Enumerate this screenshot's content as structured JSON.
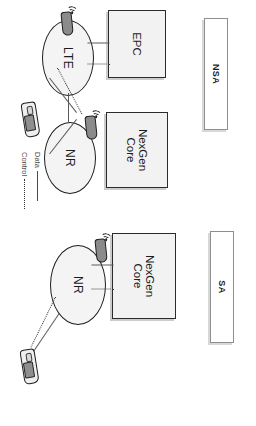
{
  "figure": {
    "sections": [
      {
        "id": "nsa",
        "plaque_label": "NSA",
        "core_boxes": [
          {
            "id": "epc",
            "label": "EPC"
          },
          {
            "id": "nexgen_core",
            "label": "NexGen\nCore"
          }
        ],
        "cells": [
          {
            "id": "lte",
            "label": "LTE"
          },
          {
            "id": "nr",
            "label": "NR"
          }
        ],
        "devices": [
          {
            "id": "ue",
            "icon": "handset-icon"
          },
          {
            "id": "lte-antenna",
            "icon": "antenna-icon"
          },
          {
            "id": "nr-antenna",
            "icon": "antenna-icon"
          }
        ],
        "links": [
          {
            "from": "epc",
            "to": "lte",
            "type": "Data"
          },
          {
            "from": "epc",
            "to": "lte",
            "type": "Control"
          },
          {
            "from": "lte",
            "to": "nr",
            "type": "Data"
          },
          {
            "from": "ue",
            "to": "lte",
            "type": "Data"
          },
          {
            "from": "ue",
            "to": "lte",
            "type": "Control"
          },
          {
            "from": "ue",
            "to": "nr",
            "type": "Data"
          }
        ]
      },
      {
        "id": "sa",
        "plaque_label": "SA",
        "core_boxes": [
          {
            "id": "nexgen_core",
            "label": "NexGen\nCore"
          }
        ],
        "cells": [
          {
            "id": "nr",
            "label": "NR"
          }
        ],
        "devices": [
          {
            "id": "ue",
            "icon": "handset-icon"
          },
          {
            "id": "nr-antenna",
            "icon": "antenna-icon"
          }
        ],
        "links": [
          {
            "from": "nexgen_core",
            "to": "nr",
            "type": "Data"
          },
          {
            "from": "nexgen_core",
            "to": "nr",
            "type": "Control"
          },
          {
            "from": "ue",
            "to": "nr",
            "type": "Data"
          },
          {
            "from": "ue",
            "to": "nr",
            "type": "Control"
          }
        ]
      }
    ],
    "legend": {
      "items": [
        {
          "label": "Data",
          "style": "solid"
        },
        {
          "label": "Control",
          "style": "dotted"
        }
      ]
    },
    "colors": {
      "line": "#5a5a5a",
      "control_line": "#3a3a3a",
      "box_fill": "#f2f2f2",
      "box_stroke": "#2b2b2b",
      "cell_fill": "#f4f4f4",
      "cell_stroke": "#1d1d1d",
      "antenna_fill": "#8b8b8b",
      "text": "#1c1c1c",
      "background": "#ffffff"
    }
  }
}
